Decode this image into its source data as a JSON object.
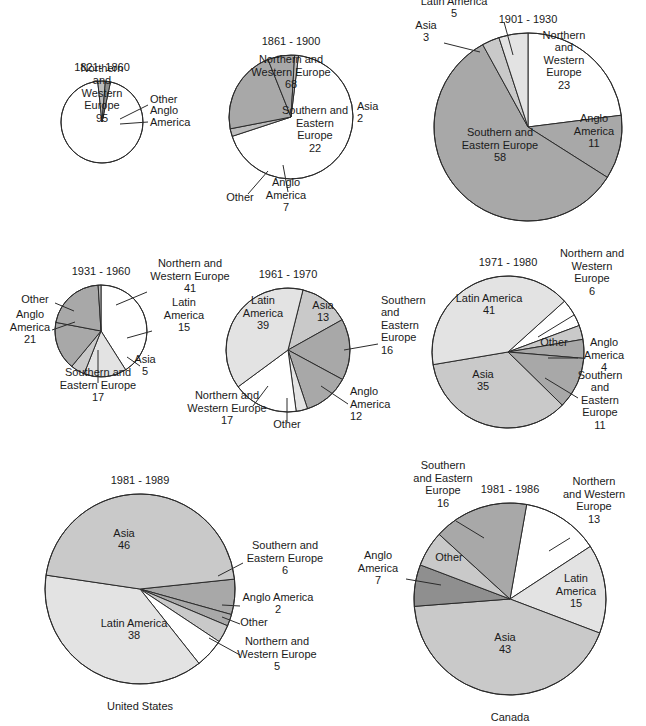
{
  "figure": {
    "type": "pie-chart-grid",
    "background": "#ffffff",
    "palette": {
      "northern_and_western_europe": "#ffffff",
      "latin_america": "#e3e3e3",
      "asia": "#c9c9c9",
      "southern_and_eastern_europe": "#a8a8a8",
      "anglo_america": "#8f8f8f",
      "other": "#bdbdbd",
      "outline": "#2b2b2b"
    }
  },
  "chart_data": [
    {
      "id": "us-1821-1860",
      "type": "pie",
      "title": "1821- 1860",
      "caption": "",
      "labels": [
        "Northern and Western Europe",
        "Other",
        "Anglo America"
      ],
      "values": [
        95,
        3,
        2
      ],
      "value_text": [
        "95",
        "",
        ""
      ],
      "colors": [
        "#ffffff",
        "#bdbdbd",
        "#8f8f8f"
      ],
      "cx": 102,
      "cy": 122,
      "r": 41,
      "start_angle": 78,
      "label_placements": [
        {
          "text": "Northern\nand\nWestern\nEurope\n95",
          "x": 102,
          "y": 93,
          "align": "c",
          "leader": null
        },
        {
          "text": "Other",
          "x": 150,
          "y": 99,
          "align": "l",
          "leader": [
            [
              148,
              105
            ],
            [
              120,
              119
            ]
          ]
        },
        {
          "text": "Anglo\nAmerica",
          "x": 150,
          "y": 116,
          "align": "l",
          "leader": [
            [
              148,
              122
            ],
            [
              120,
              124
            ]
          ]
        }
      ]
    },
    {
      "id": "us-1861-1900",
      "type": "pie",
      "title": "1861 - 1900",
      "caption": "",
      "labels": [
        "Northern and Western Europe",
        "Asia",
        "Southern and Eastern Europe",
        "Anglo America",
        "Other"
      ],
      "values": [
        68,
        2,
        22,
        7,
        1
      ],
      "value_text": [
        "68",
        "2",
        "22",
        "7",
        ""
      ],
      "colors": [
        "#ffffff",
        "#bdbdbd",
        "#a8a8a8",
        "#a8a8a8",
        "#bdbdbd"
      ],
      "cx": 291,
      "cy": 117,
      "r": 62,
      "start_angle": 83,
      "label_placements": [
        {
          "text": "Northern and\nWestern Europe\n68",
          "x": 291,
          "y": 72,
          "align": "c",
          "leader": null
        },
        {
          "text": "Asia\n2",
          "x": 357,
          "y": 112,
          "align": "l",
          "leader": null
        },
        {
          "text": "Southern and\nEastern\nEurope\n22",
          "x": 315,
          "y": 129,
          "align": "c",
          "leader": null
        },
        {
          "text": "Anglo\nAmerica\n7",
          "x": 286,
          "y": 195,
          "align": "c",
          "leader": [
            [
              288,
              192
            ],
            [
              283,
              165
            ]
          ]
        },
        {
          "text": "Other",
          "x": 240,
          "y": 197,
          "align": "c",
          "leader": [
            [
              248,
              194
            ],
            [
              268,
              171
            ]
          ]
        }
      ]
    },
    {
      "id": "us-1901-1930",
      "type": "pie",
      "title": "1901 - 1930",
      "caption": "",
      "labels": [
        "Northern and Western Europe",
        "Anglo America",
        "Southern and Eastern Europe",
        "Asia",
        "Latin America"
      ],
      "values": [
        23,
        11,
        58,
        3,
        5
      ],
      "value_text": [
        "23",
        "11",
        "58",
        "3",
        "5"
      ],
      "colors": [
        "#ffffff",
        "#a8a8a8",
        "#a8a8a8",
        "#c9c9c9",
        "#e3e3e3"
      ],
      "cx": 528,
      "cy": 127,
      "r": 94,
      "start_angle": 90,
      "label_placements": [
        {
          "text": "Northern\nand\nWestern\nEurope\n23",
          "x": 564,
          "y": 60,
          "align": "c",
          "leader": null
        },
        {
          "text": "Anglo\nAmerica\n11",
          "x": 594,
          "y": 131,
          "align": "c",
          "leader": null
        },
        {
          "text": "Southern and\nEastern Europe\n58",
          "x": 500,
          "y": 145,
          "align": "c",
          "leader": null
        },
        {
          "text": "Latin America\n5",
          "x": 454,
          "y": 7,
          "align": "c",
          "leader": [
            [
              504,
              22
            ],
            [
              513,
              55
            ]
          ]
        },
        {
          "text": "Asia\n3",
          "x": 426,
          "y": 31,
          "align": "c",
          "leader": [
            [
              444,
              43
            ],
            [
              480,
              52
            ]
          ]
        }
      ]
    },
    {
      "id": "us-1931-1960",
      "type": "pie",
      "title": "1931 - 1960",
      "caption": "",
      "labels": [
        "Northern and Western Europe",
        "Latin America",
        "Asia",
        "Southern and Eastern Europe",
        "Anglo America",
        "Other"
      ],
      "values": [
        41,
        15,
        5,
        17,
        21,
        1
      ],
      "value_text": [
        "41",
        "15",
        "5",
        "17",
        "21",
        ""
      ],
      "colors": [
        "#ffffff",
        "#e3e3e3",
        "#c9c9c9",
        "#a8a8a8",
        "#a8a8a8",
        "#bdbdbd"
      ],
      "cx": 101,
      "cy": 331,
      "r": 46,
      "start_angle": 90,
      "label_placements": [
        {
          "text": "Northern and\nWestern Europe\n41",
          "x": 190,
          "y": 276,
          "align": "c",
          "leader": [
            [
              147,
              292
            ],
            [
              116,
              305
            ]
          ]
        },
        {
          "text": "Latin\nAmerica\n15",
          "x": 184,
          "y": 315,
          "align": "c",
          "leader": [
            [
              152,
              331
            ],
            [
              127,
              338
            ]
          ]
        },
        {
          "text": "Asia\n5",
          "x": 145,
          "y": 365,
          "align": "c",
          "leader": [
            [
              140,
              366
            ],
            [
              127,
              357
            ]
          ]
        },
        {
          "text": "Southern and\nEastern Europe\n17",
          "x": 98,
          "y": 385,
          "align": "c",
          "leader": [
            [
              98,
              383
            ],
            [
              98,
              350
            ]
          ]
        },
        {
          "text": "Anglo\nAmerica\n21",
          "x": 30,
          "y": 327,
          "align": "c",
          "leader": [
            [
              52,
              330
            ],
            [
              75,
              322
            ]
          ]
        },
        {
          "text": "Other",
          "x": 35,
          "y": 299,
          "align": "c",
          "leader": [
            [
              55,
              303
            ],
            [
              74,
              311
            ]
          ]
        }
      ]
    },
    {
      "id": "us-1961-1970",
      "type": "pie",
      "title": "1961 - 1970",
      "caption": "",
      "labels": [
        "Asia",
        "Southern and Eastern Europe",
        "Anglo America",
        "Other",
        "Northern and Western Europe",
        "Latin America"
      ],
      "values": [
        13,
        16,
        12,
        3,
        17,
        39
      ],
      "value_text": [
        "13",
        "16",
        "12",
        "",
        "17",
        "39"
      ],
      "colors": [
        "#c9c9c9",
        "#a8a8a8",
        "#a8a8a8",
        "#e3e3e3",
        "#ffffff",
        "#e3e3e3"
      ],
      "cx": 288,
      "cy": 350,
      "r": 62,
      "start_angle": 76,
      "label_placements": [
        {
          "text": "Asia\n13",
          "x": 323,
          "y": 311,
          "align": "c",
          "leader": null
        },
        {
          "text": "Southern\nand\nEastern\nEurope\n16",
          "x": 381,
          "y": 325,
          "align": "l",
          "leader": [
            [
              378,
              344
            ],
            [
              344,
              350
            ]
          ]
        },
        {
          "text": "Anglo\nAmerica\n12",
          "x": 350,
          "y": 404,
          "align": "l",
          "leader": [
            [
              348,
              404
            ],
            [
              321,
              386
            ]
          ]
        },
        {
          "text": "Other",
          "x": 287,
          "y": 424,
          "align": "c",
          "leader": [
            [
              287,
              422
            ],
            [
              287,
              398
            ]
          ]
        },
        {
          "text": "Northern and\nWestern Europe\n17",
          "x": 227,
          "y": 408,
          "align": "c",
          "leader": [
            [
              253,
              406
            ],
            [
              268,
              386
            ]
          ]
        },
        {
          "text": "Latin\nAmerica\n39",
          "x": 263,
          "y": 313,
          "align": "c",
          "leader": null
        }
      ]
    },
    {
      "id": "us-1971-1980",
      "type": "pie",
      "title": "1971 - 1980",
      "caption": "",
      "labels": [
        "Northern and Western Europe",
        "Other",
        "Anglo America",
        "Southern and Eastern Europe",
        "Asia",
        "Latin America"
      ],
      "values": [
        6,
        3,
        4,
        11,
        35,
        41
      ],
      "value_text": [
        "6",
        "",
        "4",
        "11",
        "35",
        "41"
      ],
      "colors": [
        "#ffffff",
        "#c9c9c9",
        "#a8a8a8",
        "#a8a8a8",
        "#c9c9c9",
        "#e3e3e3"
      ],
      "cx": 508,
      "cy": 352,
      "r": 76,
      "start_angle": 42,
      "label_placements": [
        {
          "text": "Northern and\nWestern\nEurope\n6",
          "x": 592,
          "y": 272,
          "align": "c",
          "leader": [
            [
              574,
              315
            ],
            [
              538,
              337
            ]
          ]
        },
        {
          "text": "Other",
          "x": 554,
          "y": 342,
          "align": "c",
          "leader": null
        },
        {
          "text": "Anglo\nAmerica\n4",
          "x": 604,
          "y": 355,
          "align": "c",
          "leader": [
            [
              578,
              358
            ],
            [
              548,
              358
            ]
          ]
        },
        {
          "text": "Southern\nand\nEastern\nEurope\n11",
          "x": 600,
          "y": 400,
          "align": "c",
          "leader": [
            [
              578,
              398
            ],
            [
              545,
              378
            ]
          ]
        },
        {
          "text": "Asia\n35",
          "x": 483,
          "y": 380,
          "align": "c",
          "leader": null
        },
        {
          "text": "Latin America\n41",
          "x": 489,
          "y": 304,
          "align": "c",
          "leader": null
        }
      ]
    },
    {
      "id": "us-1981-1989",
      "type": "pie",
      "title": "1981 - 1989",
      "caption": "United States",
      "labels": [
        "Southern and Eastern Europe",
        "Anglo America",
        "Other",
        "Northern and Western Europe",
        "Latin America",
        "Asia"
      ],
      "values": [
        6,
        2,
        3,
        5,
        38,
        46
      ],
      "value_text": [
        "6",
        "2",
        "",
        "5",
        "38",
        "46"
      ],
      "colors": [
        "#a8a8a8",
        "#a8a8a8",
        "#c9c9c9",
        "#ffffff",
        "#e3e3e3",
        "#c9c9c9"
      ],
      "cx": 140,
      "cy": 589,
      "r": 95,
      "start_angle": 6,
      "label_placements": [
        {
          "text": "Southern and\nEastern Europe\n6",
          "x": 285,
          "y": 558,
          "align": "c",
          "leader": [
            [
              243,
              563
            ],
            [
              218,
              576
            ]
          ]
        },
        {
          "text": "Anglo America\n2",
          "x": 278,
          "y": 603,
          "align": "c",
          "leader": [
            [
              240,
              606
            ],
            [
              222,
              605
            ]
          ]
        },
        {
          "text": "Other",
          "x": 254,
          "y": 622,
          "align": "c",
          "leader": [
            [
              240,
              624
            ],
            [
              222,
              617
            ]
          ]
        },
        {
          "text": "Northern and\nWestern Europe\n5",
          "x": 277,
          "y": 654,
          "align": "c",
          "leader": [
            [
              240,
              655
            ],
            [
              209,
              638
            ]
          ]
        },
        {
          "text": "Latin America\n38",
          "x": 134,
          "y": 629,
          "align": "c",
          "leader": null
        },
        {
          "text": "Asia\n46",
          "x": 124,
          "y": 539,
          "align": "c",
          "leader": null
        }
      ]
    },
    {
      "id": "canada-1981-1986",
      "type": "pie",
      "title": "1981 - 1986",
      "caption": "Canada",
      "labels": [
        "Northern and Western Europe",
        "Latin America",
        "Asia",
        "Anglo America",
        "Other",
        "Southern and Eastern Europe"
      ],
      "values": [
        13,
        15,
        43,
        7,
        6,
        16
      ],
      "value_text": [
        "13",
        "15",
        "43",
        "7",
        "",
        "16"
      ],
      "colors": [
        "#ffffff",
        "#e3e3e3",
        "#c9c9c9",
        "#8f8f8f",
        "#c9c9c9",
        "#a8a8a8"
      ],
      "cx": 510,
      "cy": 599,
      "r": 96,
      "start_angle": 80,
      "label_placements": [
        {
          "text": "Northern\nand Western\nEurope\n13",
          "x": 594,
          "y": 500,
          "align": "c",
          "leader": [
            [
              570,
              538
            ],
            [
              549,
              551
            ]
          ]
        },
        {
          "text": "Latin\nAmerica\n15",
          "x": 576,
          "y": 591,
          "align": "c",
          "leader": null
        },
        {
          "text": "Asia\n43",
          "x": 505,
          "y": 643,
          "align": "c",
          "leader": null
        },
        {
          "text": "Anglo\nAmerica\n7",
          "x": 378,
          "y": 568,
          "align": "c",
          "leader": [
            [
              406,
              579
            ],
            [
              441,
              585
            ]
          ]
        },
        {
          "text": "Other",
          "x": 449,
          "y": 557,
          "align": "c",
          "leader": null
        },
        {
          "text": "Southern\nand Eastern\nEurope\n16",
          "x": 443,
          "y": 484,
          "align": "c",
          "leader": [
            [
              456,
              521
            ],
            [
              484,
              538
            ]
          ]
        }
      ]
    }
  ]
}
